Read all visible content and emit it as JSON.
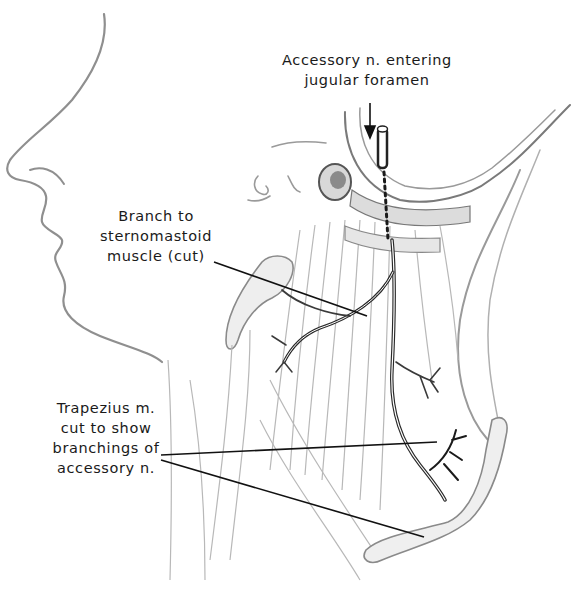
{
  "figure": {
    "labels": {
      "accessory_entering": {
        "lines": [
          "Accessory n. entering",
          "jugular foramen"
        ]
      },
      "branch_sternomastoid": {
        "lines": [
          "Branch to",
          "sternomastoid",
          "muscle (cut)"
        ]
      },
      "trapezius": {
        "lines": [
          "Trapezius m.",
          "cut to show",
          "branchings of",
          "accessory n."
        ]
      }
    },
    "colors": {
      "ink": "#1a1a1a",
      "outline": "#8a8a8a",
      "shading": "#b5b5b5",
      "nerve": "#2a2a2a",
      "background": "#ffffff"
    }
  }
}
